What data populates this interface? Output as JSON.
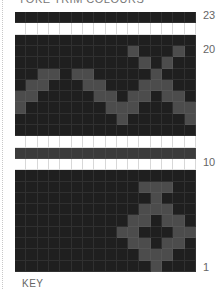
{
  "title": "YOKE TRIM COLOURS",
  "key_label": "KEY",
  "colors": {
    "dark": "#1f1f1f",
    "motif": "#4c4c4c",
    "band": "#3b3b3b",
    "white": "#ffffff"
  },
  "chart_data": {
    "type": "heatmap",
    "title": "YOKE TRIM COLOURS",
    "columns": 16,
    "rows": 23,
    "row_tick_labels": [
      {
        "row": 23,
        "label": "23"
      },
      {
        "row": 20,
        "label": "20"
      },
      {
        "row": 10,
        "label": "10"
      },
      {
        "row": 1,
        "label": "1"
      }
    ],
    "row_backgrounds": {
      "23": "dark",
      "22": "white",
      "21": "dark",
      "20": "dark",
      "19": "dark",
      "18": "dark",
      "17": "dark",
      "16": "dark",
      "15": "dark",
      "14": "dark",
      "13": "dark",
      "12": "white",
      "11": "band",
      "10": "white",
      "9": "dark",
      "8": "dark",
      "7": "dark",
      "6": "dark",
      "5": "dark",
      "4": "dark",
      "3": "dark",
      "2": "dark",
      "1": "dark"
    },
    "motif_cells": {
      "20": [
        10,
        14
      ],
      "19": [
        11,
        13
      ],
      "18": [
        2,
        3,
        5,
        6,
        12
      ],
      "17": [
        1,
        2,
        6,
        7,
        11,
        12,
        13
      ],
      "16": [
        0,
        1,
        7,
        8,
        10,
        11,
        13,
        14
      ],
      "15": [
        0,
        8,
        9,
        10,
        14,
        15
      ],
      "14": [
        9,
        15
      ],
      "8": [
        11,
        12,
        13
      ],
      "7": [
        12
      ],
      "6": [
        11,
        12,
        13
      ],
      "5": [
        10,
        11,
        13,
        14
      ],
      "4": [
        9,
        10,
        14,
        15
      ],
      "3": [
        10,
        11,
        13,
        14
      ],
      "2": [
        11,
        12,
        13
      ],
      "1": [
        12
      ]
    },
    "legend": "KEY"
  }
}
